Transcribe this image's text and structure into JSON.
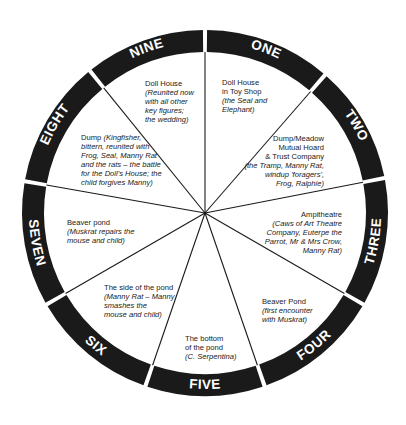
{
  "diagram": {
    "type": "circular-stage-wheel",
    "colors": {
      "ring": "#1a1a1a",
      "ring_text": "#ffffff",
      "divider": "#1a1a1a",
      "background": "#ffffff",
      "text": "#1a1a1a"
    },
    "segments": [
      {
        "number": "ONE",
        "title": "Doll House in Toy Shop",
        "title_lines": [
          "Doll House",
          "in Toy Shop"
        ],
        "detail_lines": [
          "(the Seal and",
          "Elephant)"
        ]
      },
      {
        "number": "TWO",
        "title": "Dump/Meadow Mutual Hoard & Trust Company",
        "title_lines": [
          "Dump/Meadow",
          "Mutual Hoard",
          "& Trust Company"
        ],
        "detail_lines": [
          "(the Tramp, Manny Rat,",
          "windup 'foragers',",
          "Frog, Ralphie)"
        ]
      },
      {
        "number": "THREE",
        "title": "Ampitheatre",
        "title_lines": [
          "Ampitheatre"
        ],
        "detail_lines": [
          "(Caws of Art Theatre",
          "Company, Euterpe the",
          "Parrot, Mr & Mrs Crow,",
          "Manny Rat)"
        ]
      },
      {
        "number": "FOUR",
        "title": "Beaver Pond",
        "title_lines": [
          "Beaver Pond"
        ],
        "detail_lines": [
          "(first encounter",
          "with Muskrat)"
        ]
      },
      {
        "number": "FIVE",
        "title": "The bottom of the pond",
        "title_lines": [
          "The bottom",
          "of the pond"
        ],
        "detail_lines": [
          "(C. Serpentina)"
        ]
      },
      {
        "number": "SIX",
        "title": "The side of the pond",
        "title_lines": [
          "The side of the pond"
        ],
        "detail_lines": [
          "(Manny Rat – Manny",
          "smashes the",
          "mouse and child)"
        ]
      },
      {
        "number": "SEVEN",
        "title": "Beaver pond",
        "title_lines": [
          "Beaver pond"
        ],
        "detail_lines": [
          "(Muskrat repairs the",
          "mouse and child)"
        ]
      },
      {
        "number": "EIGHT",
        "title": "Dump",
        "title_lines": [
          "Dump"
        ],
        "detail_lines": [
          "(Kingfisher,",
          "bittern, reunited with",
          "Frog, Seal, Manny Rat",
          "and the rats – the battle",
          "for the Doll's House; the",
          "child forgives Manny)"
        ]
      },
      {
        "number": "NINE",
        "title": "Doll House",
        "title_lines": [
          "Doll House"
        ],
        "detail_lines": [
          "(Reunited now",
          "with all other",
          "key figures;",
          "the wedding)"
        ]
      }
    ]
  }
}
